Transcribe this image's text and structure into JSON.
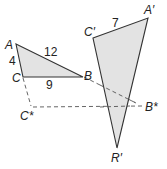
{
  "diagram": {
    "type": "geometry-similar-triangles",
    "colors": {
      "fill": "#e3e3e3",
      "stroke": "#333333",
      "dashed": "#555555",
      "text": "#222222"
    },
    "triangle_abc": {
      "vertices": {
        "A": "A",
        "B": "B",
        "C": "C"
      },
      "sides": {
        "AB": "12",
        "AC": "4",
        "CB": "9"
      }
    },
    "triangle_prime": {
      "vertices": {
        "A": "A′",
        "C": "C′",
        "R": "R′"
      },
      "sides": {
        "CA": "7"
      }
    },
    "construction": {
      "points": {
        "C_star": "C*",
        "B_star": "B*"
      },
      "dashed_segments": [
        "C–C*",
        "C*–B*",
        "B–B*"
      ]
    }
  }
}
